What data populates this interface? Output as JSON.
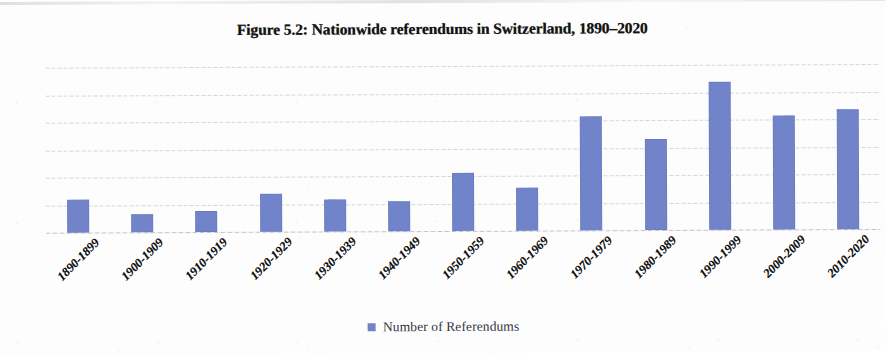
{
  "chart_data": {
    "type": "bar",
    "title": "Figure 5.2: Nationwide referendums in Switzerland, 1890–2020",
    "xlabel": "",
    "ylabel": "",
    "categories": [
      "1890-1899",
      "1900-1909",
      "1910-1919",
      "1920-1929",
      "1930-1939",
      "1940-1949",
      "1950-1959",
      "1960-1969",
      "1970-1979",
      "1980-1989",
      "1990-1999",
      "2000-2009",
      "2010-2020"
    ],
    "series": [
      {
        "name": "Number of Referendums",
        "color": "#7183c9",
        "values": [
          24,
          13,
          15,
          28,
          23,
          22,
          42,
          31,
          83,
          66,
          108,
          83,
          87
        ]
      }
    ],
    "values": [
      24,
      13,
      15,
      28,
      23,
      22,
      42,
      31,
      83,
      66,
      108,
      83,
      87
    ],
    "ylim": [
      0,
      120
    ],
    "ytick_labels": [
      "0",
      "20",
      "40",
      "60",
      "80",
      "100",
      "120"
    ],
    "ytick_values": [
      0,
      20,
      40,
      60,
      80,
      100,
      120
    ],
    "grid": true,
    "grid_axis": "y",
    "grid_style": "dotted",
    "grid_color": "#c9cdd6",
    "legend": {
      "position": "bottom",
      "entries": [
        {
          "label": "Number of Referendums",
          "color": "#7183c9",
          "marker": "square"
        }
      ]
    },
    "xtick_rotation": -45,
    "bar_color": "#7183c9"
  }
}
